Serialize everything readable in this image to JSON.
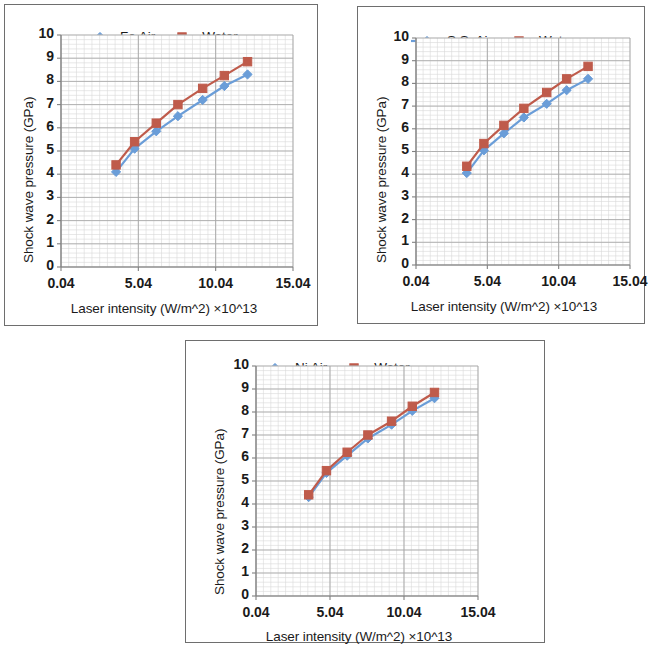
{
  "figure": {
    "panel_count": 3,
    "background": "#ffffff",
    "border_color": "#6e6e6e"
  },
  "common": {
    "ylabel": "Shock wave pressure (GPa)",
    "xlabel": "Laser intensity (W/m^2) ×10^13",
    "yticks": [
      "10",
      "9",
      "8",
      "7",
      "6",
      "5",
      "4",
      "3",
      "2",
      "1",
      "0"
    ],
    "xticks": [
      "0.04",
      "5.04",
      "10.04",
      "15.04"
    ],
    "colors": {
      "air": "#6A9DD8",
      "water": "#BF5B4B",
      "axis": "#808080",
      "gridline_major": "#a8a8a8",
      "gridline_minor": "#d9d9d9",
      "text": "#1a1a1a"
    }
  },
  "chart_data": [
    {
      "type": "line",
      "title": "",
      "panel": "fe",
      "xlabel": "Laser intensity (W/m^2) ×10^13",
      "ylabel": "Shock wave pressure (GPa)",
      "xlim": [
        0.04,
        15.04
      ],
      "ylim": [
        0,
        10
      ],
      "xticks": [
        0.04,
        5.04,
        10.04,
        15.04
      ],
      "yticks": [
        0,
        1,
        2,
        3,
        4,
        5,
        6,
        7,
        8,
        9,
        10
      ],
      "grid": true,
      "legend_position": "top-center",
      "x": [
        3.6,
        4.8,
        6.2,
        7.6,
        9.2,
        10.6,
        12.1
      ],
      "series": [
        {
          "name": "Fe Air",
          "marker": "diamond",
          "color": "#6A9DD8",
          "values": [
            4.1,
            5.1,
            5.85,
            6.5,
            7.2,
            7.8,
            8.3
          ]
        },
        {
          "name": "Water",
          "marker": "square",
          "color": "#BF5B4B",
          "values": [
            4.4,
            5.4,
            6.2,
            7.0,
            7.7,
            8.25,
            8.85
          ]
        }
      ]
    },
    {
      "type": "line",
      "title": "",
      "panel": "ss",
      "xlabel": "Laser intensity (W/m^2) ×10^13",
      "ylabel": "Shock wave pressure (GPa)",
      "xlim": [
        0.04,
        15.04
      ],
      "ylim": [
        0,
        10
      ],
      "xticks": [
        0.04,
        5.04,
        10.04,
        15.04
      ],
      "yticks": [
        0,
        1,
        2,
        3,
        4,
        5,
        6,
        7,
        8,
        9,
        10
      ],
      "grid": true,
      "legend_position": "top-center",
      "x": [
        3.6,
        4.8,
        6.2,
        7.6,
        9.2,
        10.6,
        12.1
      ],
      "series": [
        {
          "name": "S.S. Air",
          "marker": "diamond",
          "color": "#6A9DD8",
          "values": [
            4.05,
            5.05,
            5.8,
            6.5,
            7.1,
            7.7,
            8.2
          ]
        },
        {
          "name": "Water",
          "marker": "square",
          "color": "#BF5B4B",
          "values": [
            4.35,
            5.35,
            6.15,
            6.9,
            7.6,
            8.2,
            8.75
          ]
        }
      ]
    },
    {
      "type": "line",
      "title": "",
      "panel": "ni",
      "xlabel": "Laser intensity (W/m^2) ×10^13",
      "ylabel": "Shock wave pressure (GPa)",
      "xlim": [
        0.04,
        15.04
      ],
      "ylim": [
        0,
        10
      ],
      "xticks": [
        0.04,
        5.04,
        10.04,
        15.04
      ],
      "yticks": [
        0,
        1,
        2,
        3,
        4,
        5,
        6,
        7,
        8,
        9,
        10
      ],
      "grid": true,
      "legend_position": "top-center",
      "x": [
        3.6,
        4.8,
        6.2,
        7.6,
        9.2,
        10.6,
        12.1
      ],
      "series": [
        {
          "name": "Ni  Air",
          "marker": "diamond",
          "color": "#6A9DD8",
          "values": [
            4.3,
            5.35,
            6.1,
            6.85,
            7.45,
            8.05,
            8.6
          ]
        },
        {
          "name": "Water",
          "marker": "square",
          "color": "#BF5B4B",
          "values": [
            4.4,
            5.45,
            6.25,
            7.0,
            7.6,
            8.25,
            8.85
          ]
        }
      ]
    }
  ]
}
